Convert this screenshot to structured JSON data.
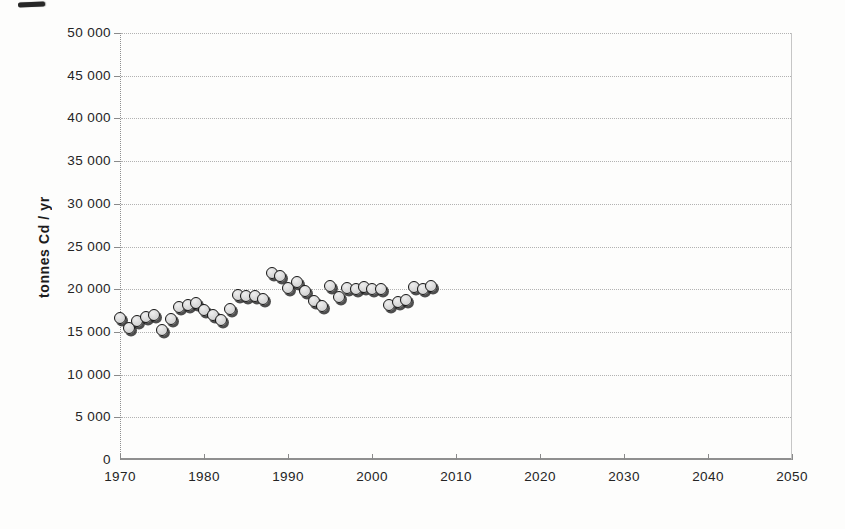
{
  "chart_data": {
    "type": "scatter",
    "title": "",
    "xlabel": "",
    "ylabel": "tonnes Cd / yr",
    "xlim": [
      1970,
      2050
    ],
    "ylim": [
      0,
      50000
    ],
    "grid": "horizontal-dotted",
    "legend": "none",
    "x_ticks": [
      1970,
      1980,
      1990,
      2000,
      2010,
      2020,
      2030,
      2040,
      2050
    ],
    "y_ticks": [
      0,
      5000,
      10000,
      15000,
      20000,
      25000,
      30000,
      35000,
      40000,
      45000,
      50000
    ],
    "y_tick_labels": [
      "0",
      "5 000",
      "10 000",
      "15 000",
      "20 000",
      "25 000",
      "30 000",
      "35 000",
      "40 000",
      "45 000",
      "50 000"
    ],
    "x": [
      1970,
      1971,
      1972,
      1973,
      1974,
      1975,
      1976,
      1977,
      1978,
      1979,
      1980,
      1981,
      1982,
      1983,
      1984,
      1985,
      1986,
      1987,
      1988,
      1989,
      1990,
      1991,
      1992,
      1993,
      1994,
      1995,
      1996,
      1997,
      1998,
      1999,
      2000,
      2001,
      2002,
      2003,
      2004,
      2005,
      2006,
      2007
    ],
    "y": [
      16500,
      15400,
      16200,
      16700,
      16900,
      15100,
      16400,
      17800,
      18100,
      18300,
      17500,
      16900,
      16300,
      17600,
      19300,
      19100,
      19100,
      18800,
      21800,
      21500,
      20100,
      20800,
      19700,
      18600,
      18000,
      20300,
      19000,
      20100,
      20000,
      20200,
      20000,
      19900,
      18100,
      18400,
      18700,
      20200,
      20000,
      20300
    ],
    "marker": {
      "shape": "circle",
      "fill_color": "#d9d9d9",
      "border_color": "#141414",
      "shadow_color": "#2a2a2a"
    },
    "colors": {
      "grid": "#b2b2b2",
      "axis": "#8f8f8f",
      "text": "#242424",
      "background": "#fdfdfc"
    }
  }
}
